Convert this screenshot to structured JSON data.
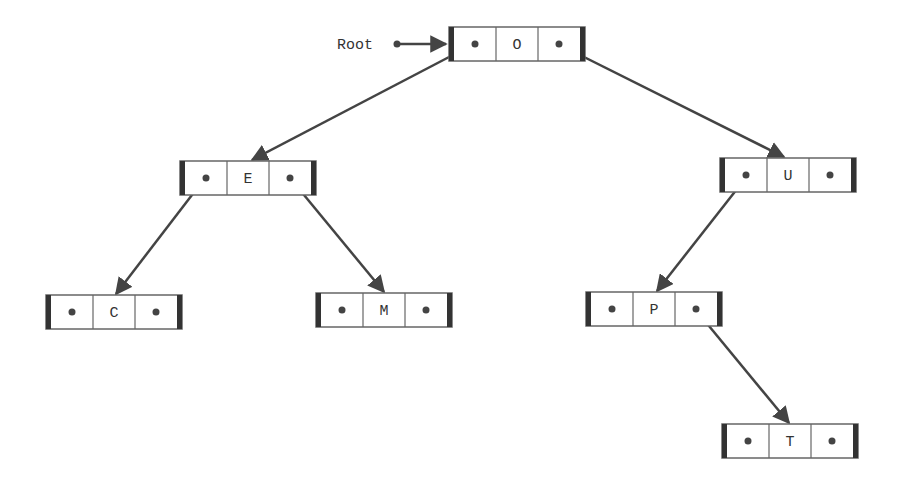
{
  "diagram": {
    "type": "binary-search-tree",
    "root_label": "Root",
    "colors": {
      "line": "#444444",
      "box_border": "#555555",
      "box_end_bar": "#333333",
      "text": "#333333",
      "background": "#ffffff"
    },
    "nodes": [
      {
        "id": "O",
        "label": "O",
        "left": null,
        "right": "U",
        "x": 449,
        "y": 27
      },
      {
        "id": "E",
        "label": "E",
        "left": "C",
        "right": "M",
        "x": 180,
        "y": 161
      },
      {
        "id": "U",
        "label": "U",
        "left": "P",
        "right": null,
        "x": 720,
        "y": 158
      },
      {
        "id": "C",
        "label": "C",
        "left": null,
        "right": null,
        "x": 46,
        "y": 295
      },
      {
        "id": "M",
        "label": "M",
        "left": null,
        "right": null,
        "x": 316,
        "y": 293
      },
      {
        "id": "P",
        "label": "P",
        "left": null,
        "right": "T",
        "x": 586,
        "y": 292
      },
      {
        "id": "T",
        "label": "T",
        "left": null,
        "right": null,
        "x": 722,
        "y": 424
      }
    ],
    "edges": [
      {
        "from": "Root",
        "to": "O"
      },
      {
        "from": "O",
        "to": "E",
        "side": "left"
      },
      {
        "from": "O",
        "to": "U",
        "side": "right"
      },
      {
        "from": "E",
        "to": "C",
        "side": "left"
      },
      {
        "from": "E",
        "to": "M",
        "side": "right"
      },
      {
        "from": "U",
        "to": "P",
        "side": "left"
      },
      {
        "from": "P",
        "to": "T",
        "side": "right"
      }
    ]
  }
}
